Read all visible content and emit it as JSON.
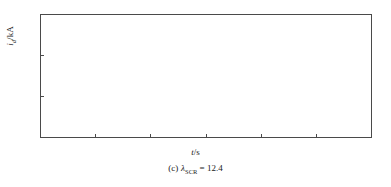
{
  "figure": {
    "caption_prefix": "(c)",
    "caption_symbol": "λ",
    "caption_subscript": "SCR",
    "caption_equals": "=",
    "caption_value": "12.4",
    "caption_full": "(c) λSCR = 12.4"
  },
  "axes": {
    "xlabel_var": "t",
    "xlabel_unit": "/s",
    "xlabel_full": "t/s",
    "ylabel_var": "i",
    "ylabel_sub": "d",
    "ylabel_unit": "/kA",
    "ylabel_full": "id/kA"
  },
  "chart_data": {
    "type": "line",
    "title": "",
    "xlabel": "t/s",
    "ylabel": "id/kA",
    "xlim": [
      0.9,
      1.5
    ],
    "ylim": [
      -4,
      2
    ],
    "xticks": [
      "0.9",
      "1.0",
      "1.1",
      "1.2",
      "1.3",
      "1.4",
      "1.5"
    ],
    "xtick_values": [
      0.9,
      1.0,
      1.1,
      1.2,
      1.3,
      1.4,
      1.5
    ],
    "yticks": [
      "2",
      "0",
      "-2",
      "-4"
    ],
    "ytick_values": [
      2,
      0,
      -2,
      -4
    ],
    "grid": false,
    "legend": null,
    "series": [
      {
        "name": "DC current id",
        "description": "Steady small ripple near 0 kA until t=1.115 s, then a train of sharp negative commutation-failure spikes of decaying depth to t=1.5 s",
        "ripple": {
          "t_start": 0.905,
          "t_end": 1.0,
          "period": 0.0125,
          "baseline": 0.0,
          "amplitude": 0.1
        },
        "baseline_after": 0.0,
        "spikes": [
          {
            "t": 1.1165,
            "depth": -2.32,
            "width": 0.0075
          },
          {
            "t": 1.1385,
            "depth": -2.22,
            "width": 0.0075
          },
          {
            "t": 1.1605,
            "depth": -1.78,
            "width": 0.0072
          },
          {
            "t": 1.179,
            "depth": -1.73,
            "width": 0.0072
          },
          {
            "t": 1.1975,
            "depth": -1.52,
            "width": 0.007
          },
          {
            "t": 1.216,
            "depth": -1.27,
            "width": 0.007
          },
          {
            "t": 1.235,
            "depth": -1.22,
            "width": 0.0068
          },
          {
            "t": 1.254,
            "depth": -1.18,
            "width": 0.0068
          },
          {
            "t": 1.273,
            "depth": -1.06,
            "width": 0.0066
          },
          {
            "t": 1.292,
            "depth": -1.0,
            "width": 0.0066
          },
          {
            "t": 1.311,
            "depth": -0.95,
            "width": 0.0064
          },
          {
            "t": 1.33,
            "depth": -0.92,
            "width": 0.0064
          },
          {
            "t": 1.349,
            "depth": -0.88,
            "width": 0.0062
          },
          {
            "t": 1.368,
            "depth": -0.84,
            "width": 0.0062
          },
          {
            "t": 1.387,
            "depth": -0.8,
            "width": 0.006
          },
          {
            "t": 1.406,
            "depth": -0.76,
            "width": 0.006
          },
          {
            "t": 1.425,
            "depth": -0.73,
            "width": 0.0058
          },
          {
            "t": 1.444,
            "depth": -0.7,
            "width": 0.0058
          },
          {
            "t": 1.463,
            "depth": -0.67,
            "width": 0.0056
          },
          {
            "t": 1.482,
            "depth": -0.64,
            "width": 0.0056
          }
        ]
      }
    ]
  }
}
